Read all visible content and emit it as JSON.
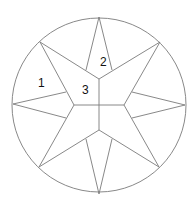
{
  "diagram": {
    "type": "compass-star-in-circle",
    "circle": {
      "cx": 99,
      "cy": 105,
      "r": 87
    },
    "stroke_color": "#7a7a7a",
    "labels": [
      {
        "text": "1",
        "x": 38,
        "y": 87
      },
      {
        "text": "2",
        "x": 100,
        "y": 66
      },
      {
        "text": "3",
        "x": 82,
        "y": 94
      }
    ]
  }
}
